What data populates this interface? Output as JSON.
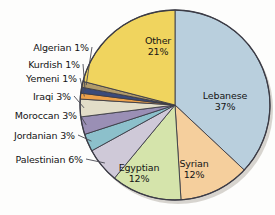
{
  "chart_data": {
    "type": "pie",
    "title": "",
    "subtitle": "",
    "xlabel": "",
    "ylabel": "",
    "units": "percent",
    "legend_position": "none",
    "grid": false,
    "label_style": "slice-labels-with-leader-lines",
    "start_angle_deg": 0,
    "direction": "clockwise",
    "categories": [
      "Lebanese",
      "Syrian",
      "Egyptian",
      "Palestinian",
      "Jordanian",
      "Moroccan",
      "Iraqi",
      "Yemeni",
      "Kurdish",
      "Algerian",
      "Other"
    ],
    "values": [
      37,
      12,
      12,
      6,
      3,
      3,
      3,
      1,
      1,
      1,
      21
    ],
    "colors": [
      "#b9cfdd",
      "#f5cf9d",
      "#d5e4ab",
      "#cfc9d8",
      "#8cc0cb",
      "#9a8fb5",
      "#e2ddc8",
      "#eda14a",
      "#3a4a7a",
      "#b09a6a",
      "#f0d45e"
    ],
    "slices": [
      {
        "label": "Lebanese",
        "value": 37,
        "value_text": "37%",
        "color": "#b9cfdd",
        "label_placement": "inside"
      },
      {
        "label": "Syrian",
        "value": 12,
        "value_text": "12%",
        "color": "#f5cf9d",
        "label_placement": "inside"
      },
      {
        "label": "Egyptian",
        "value": 12,
        "value_text": "12%",
        "color": "#d5e4ab",
        "label_placement": "inside"
      },
      {
        "label": "Palestinian",
        "value": 6,
        "value_text": "6%",
        "color": "#cfc9d8",
        "label_placement": "outside"
      },
      {
        "label": "Jordanian",
        "value": 3,
        "value_text": "3%",
        "color": "#8cc0cb",
        "label_placement": "outside"
      },
      {
        "label": "Moroccan",
        "value": 3,
        "value_text": "3%",
        "color": "#9a8fb5",
        "label_placement": "outside"
      },
      {
        "label": "Iraqi",
        "value": 3,
        "value_text": "3%",
        "color": "#e2ddc8",
        "label_placement": "outside"
      },
      {
        "label": "Yemeni",
        "value": 1,
        "value_text": "1%",
        "color": "#eda14a",
        "label_placement": "outside"
      },
      {
        "label": "Kurdish",
        "value": 1,
        "value_text": "1%",
        "color": "#3a4a7a",
        "label_placement": "outside"
      },
      {
        "label": "Algerian",
        "value": 1,
        "value_text": "1%",
        "color": "#b09a6a",
        "label_placement": "outside"
      },
      {
        "label": "Other",
        "value": 21,
        "value_text": "21%",
        "color": "#f0d45e",
        "label_placement": "inside"
      }
    ]
  },
  "callouts": {
    "algerian": "Algerian 1%",
    "kurdish": "Kurdish 1%",
    "yemeni": "Yemeni 1%",
    "iraqi": "Iraqi 3%",
    "moroccan": "Moroccan 3%",
    "jordanian": "Jordanian 3%",
    "palestinian": "Palestinian 6%"
  },
  "inner_labels": {
    "other": {
      "name": "Other",
      "value": "21%"
    },
    "lebanese": {
      "name": "Lebanese",
      "value": "37%"
    },
    "syrian": {
      "name": "Syrian",
      "value": "12%"
    },
    "egyptian": {
      "name": "Egyptian",
      "value": "12%"
    }
  },
  "style": {
    "background": "#fdfdfc",
    "slice_outline": "#3c3c46",
    "leader_line": "#4a4a52",
    "shadow": "#b8b3aa"
  }
}
